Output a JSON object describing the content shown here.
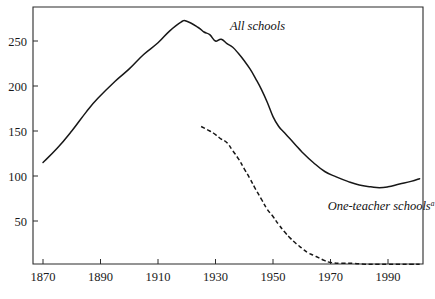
{
  "chart_data": {
    "type": "line",
    "title": "",
    "subtitle": "",
    "xlabel": "",
    "ylabel": "",
    "xlim": [
      1866,
      2002
    ],
    "ylim": [
      0,
      286
    ],
    "grid": false,
    "legend_position": "inline-annotation",
    "x_ticks": [
      1870,
      1890,
      1910,
      1930,
      1950,
      1970,
      1990
    ],
    "x_tick_labels": [
      "1870",
      "1890",
      "1910",
      "1930",
      "1950",
      "1970",
      "1990"
    ],
    "y_ticks": [
      50,
      100,
      150,
      200,
      250
    ],
    "y_tick_labels": [
      "50",
      "100",
      "150",
      "200",
      "250"
    ],
    "annotations": [
      {
        "name": "all-schools-label",
        "text": "All schools",
        "superscript": "",
        "x": 1935,
        "y": 262
      },
      {
        "name": "one-teacher-schools-label",
        "text": "One-teacher schools",
        "superscript": "a",
        "x": 1969,
        "y": 62
      }
    ],
    "series": [
      {
        "name": "All schools",
        "style": "solid",
        "color": "#171717",
        "x": [
          1870,
          1875,
          1880,
          1885,
          1889,
          1895,
          1900,
          1905,
          1910,
          1914,
          1918,
          1920,
          1924,
          1926,
          1928,
          1930,
          1932,
          1934,
          1936,
          1938,
          1940,
          1942,
          1944,
          1946,
          1948,
          1950,
          1952,
          1954,
          1956,
          1958,
          1960,
          1964,
          1968,
          1972,
          1976,
          1980,
          1984,
          1987,
          1990,
          1994,
          1998,
          2001
        ],
        "values": [
          115,
          131,
          150,
          171,
          186,
          205,
          219,
          235,
          248,
          261,
          271,
          272,
          265,
          260,
          257,
          250,
          252,
          247,
          243,
          236,
          228,
          219,
          208,
          196,
          182,
          166,
          155,
          148,
          141,
          134,
          127,
          115,
          105,
          99,
          94,
          90,
          88,
          87,
          88,
          91,
          94,
          97
        ]
      },
      {
        "name": "One-teacher schools",
        "style": "dashed",
        "color": "#171717",
        "x": [
          1925,
          1928,
          1930,
          1932,
          1934,
          1936,
          1938,
          1940,
          1942,
          1944,
          1946,
          1948,
          1950,
          1952,
          1954,
          1956,
          1958,
          1960,
          1962,
          1964,
          1966,
          1968,
          1970,
          1974,
          1978,
          1982,
          1986,
          1990,
          1994,
          1998,
          2001
        ],
        "values": [
          155,
          150,
          146,
          141,
          137,
          128,
          119,
          108,
          97,
          85,
          74,
          63,
          55,
          46,
          38,
          31,
          25,
          20,
          15,
          12,
          9,
          6,
          4,
          3,
          3,
          2,
          2,
          2,
          2,
          2,
          2
        ]
      }
    ]
  },
  "plot_geometry": {
    "left": 33,
    "right": 423,
    "top": 7,
    "bottom": 264,
    "y_zero_pixel": 266,
    "y_scale_px_per_unit": 0.9,
    "x_origin_year": 1870,
    "x_origin_pixel": 43,
    "x_px_per_year": 2.875
  }
}
